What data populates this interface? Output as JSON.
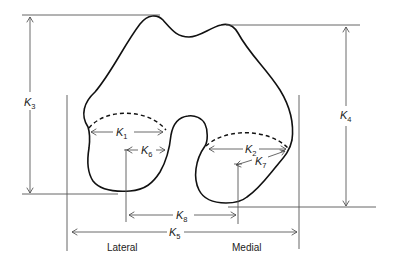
{
  "diagram": {
    "labels": {
      "k1": {
        "main": "K",
        "sub": "1"
      },
      "k2": {
        "main": "K",
        "sub": "2"
      },
      "k3": {
        "main": "K",
        "sub": "3"
      },
      "k4": {
        "main": "K",
        "sub": "4"
      },
      "k5": {
        "main": "K",
        "sub": "5"
      },
      "k6": {
        "main": "K",
        "sub": "6"
      },
      "k7": {
        "main": "K",
        "sub": "7"
      },
      "k8": {
        "main": "K",
        "sub": "8"
      }
    },
    "sides": {
      "lateral": "Lateral",
      "medial": "Medial"
    },
    "colors": {
      "outline": "#111111",
      "reference_lines": "#555555",
      "background": "#ffffff"
    }
  }
}
